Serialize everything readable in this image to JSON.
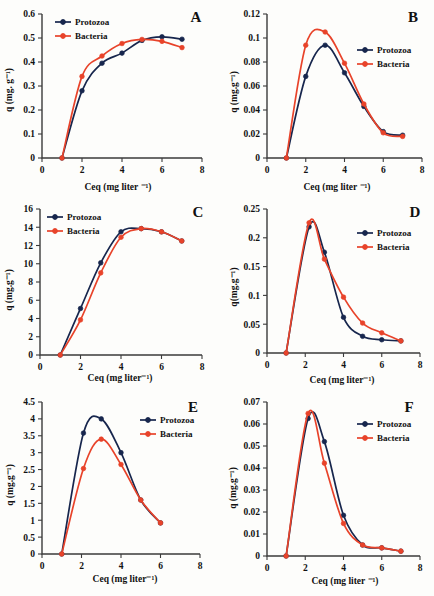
{
  "figure": {
    "legend": {
      "protozoa": "Protozoa",
      "bacteria": "Bacteria"
    },
    "colors": {
      "protozoa": "#17264d",
      "bacteria": "#e8432a"
    },
    "axis_labels": {
      "x": "Ceq (mg liter ⁻¹)",
      "x_alt": "Ceq (mg liter⁻¹)",
      "y": "q (mg. g⁻¹)",
      "y_alt": "q(mg.g⁻¹)",
      "y_f": "q (mg.g⁻¹)"
    }
  },
  "chart_data": [
    {
      "id": "A",
      "type": "line",
      "title": "A",
      "xlabel": "Ceq (mg liter ⁻¹)",
      "ylabel": "q (mg. g⁻¹)",
      "xlim": [
        0,
        8
      ],
      "ylim": [
        0,
        0.6
      ],
      "xticks": [
        0,
        2,
        4,
        6,
        8
      ],
      "yticks": [
        0,
        0.1,
        0.2,
        0.3,
        0.4,
        0.5,
        0.6
      ],
      "ytick_labels": [
        "0",
        "0.1",
        "0.2",
        "0.3",
        "0.4",
        "0.5",
        "0.6"
      ],
      "grid": false,
      "legend_position": "top-left",
      "x": [
        1,
        2,
        3,
        4,
        5,
        6,
        7
      ],
      "series": [
        {
          "name": "Protozoa",
          "values": [
            0,
            0.28,
            0.395,
            0.437,
            0.49,
            0.505,
            0.495
          ]
        },
        {
          "name": "Bacteria",
          "values": [
            0,
            0.34,
            0.425,
            0.477,
            0.494,
            0.486,
            0.46
          ]
        }
      ]
    },
    {
      "id": "B",
      "type": "line",
      "title": "B",
      "xlabel": "Ceq (mg liter ⁻¹)",
      "ylabel": "q (mg.g⁻¹)",
      "xlim": [
        0,
        8
      ],
      "ylim": [
        0,
        0.12
      ],
      "xticks": [
        0,
        2,
        4,
        6,
        8
      ],
      "yticks": [
        0,
        0.02,
        0.04,
        0.06,
        0.08,
        0.1,
        0.12
      ],
      "ytick_labels": [
        "0",
        "0.02",
        "0.04",
        "0.06",
        "0.08",
        "0.1",
        "0.12"
      ],
      "grid": false,
      "legend_position": "right",
      "x": [
        1,
        2,
        3,
        4,
        5,
        6,
        7
      ],
      "series": [
        {
          "name": "Protozoa",
          "values": [
            0,
            0.068,
            0.094,
            0.071,
            0.043,
            0.022,
            0.019
          ]
        },
        {
          "name": "Bacteria",
          "values": [
            0,
            0.094,
            0.105,
            0.079,
            0.045,
            0.021,
            0.018
          ]
        }
      ]
    },
    {
      "id": "C",
      "type": "line",
      "title": "C",
      "xlabel": "Ceq (mg liter⁻¹)",
      "ylabel": "q (mg.g⁻¹)",
      "xlim": [
        0,
        8
      ],
      "ylim": [
        0,
        16
      ],
      "xticks": [
        0,
        2,
        4,
        6,
        8
      ],
      "yticks": [
        0,
        2,
        4,
        6,
        8,
        10,
        12,
        14,
        16
      ],
      "ytick_labels": [
        "0",
        "2",
        "4",
        "6",
        "8",
        "10",
        "12",
        "14",
        "16"
      ],
      "grid": false,
      "legend_position": "top-left",
      "x": [
        1,
        2,
        3,
        4,
        5,
        6,
        7
      ],
      "series": [
        {
          "name": "Protozoa",
          "values": [
            0,
            5.1,
            10.1,
            13.5,
            13.85,
            13.5,
            12.5
          ]
        },
        {
          "name": "Bacteria",
          "values": [
            0,
            3.85,
            9.0,
            12.9,
            13.85,
            13.5,
            12.5
          ]
        }
      ]
    },
    {
      "id": "D",
      "type": "line",
      "title": "D",
      "xlabel": "Ceq (mg liter⁻¹)",
      "ylabel": "q(mg.g⁻¹)",
      "xlim": [
        0,
        8
      ],
      "ylim": [
        0,
        0.25
      ],
      "xticks": [
        0,
        2,
        4,
        6,
        8
      ],
      "yticks": [
        0,
        0.05,
        0.1,
        0.15,
        0.2,
        0.25
      ],
      "ytick_labels": [
        "0",
        "0.05",
        "0.1",
        "0.15",
        "0.2",
        "0.25"
      ],
      "grid": false,
      "legend_position": "right",
      "x": [
        1,
        2.2,
        3,
        4,
        5,
        6,
        7
      ],
      "series": [
        {
          "name": "Protozoa",
          "values": [
            0,
            0.219,
            0.175,
            0.062,
            0.029,
            0.023,
            0.021
          ]
        },
        {
          "name": "Bacteria",
          "values": [
            0,
            0.226,
            0.163,
            0.097,
            0.052,
            0.035,
            0.021
          ]
        }
      ]
    },
    {
      "id": "E",
      "type": "line",
      "title": "E",
      "xlabel": "Ceq (mg liter⁻¹)",
      "ylabel": "q (mg.g⁻¹)",
      "xlim": [
        0,
        8
      ],
      "ylim": [
        0,
        4.5
      ],
      "xticks": [
        0,
        2,
        4,
        6,
        8
      ],
      "yticks": [
        0,
        0.5,
        1,
        1.5,
        2,
        2.5,
        3,
        3.5,
        4,
        4.5
      ],
      "ytick_labels": [
        "0",
        "0.5",
        "1",
        "1.5",
        "2",
        "2.5",
        "3",
        "3.5",
        "4",
        "4.5"
      ],
      "grid": false,
      "legend_position": "right",
      "x": [
        1,
        2.1,
        3,
        4,
        5,
        6
      ],
      "series": [
        {
          "name": "Protozoa",
          "values": [
            0,
            3.58,
            4.0,
            3.0,
            1.6,
            0.92
          ]
        },
        {
          "name": "Bacteria",
          "values": [
            0,
            2.53,
            3.4,
            2.65,
            1.6,
            0.92
          ]
        }
      ]
    },
    {
      "id": "F",
      "type": "line",
      "title": "F",
      "xlabel": "Ceq (mg liter ⁻¹)",
      "ylabel": "q (mg.g⁻¹)",
      "xlim": [
        0,
        8
      ],
      "ylim": [
        0,
        0.07
      ],
      "xticks": [
        0,
        2,
        4,
        6,
        8
      ],
      "yticks": [
        0,
        0.01,
        0.02,
        0.03,
        0.04,
        0.05,
        0.06,
        0.07
      ],
      "ytick_labels": [
        "0",
        "0.01",
        "0.02",
        "0.03",
        "0.04",
        "0.05",
        "0.06",
        "0.07"
      ],
      "grid": false,
      "legend_position": "right",
      "x": [
        1,
        2.15,
        3,
        4,
        5,
        6,
        7
      ],
      "series": [
        {
          "name": "Protozoa",
          "values": [
            0,
            0.0625,
            0.052,
            0.0185,
            0.005,
            0.0037,
            0.0022
          ]
        },
        {
          "name": "Bacteria",
          "values": [
            0,
            0.0648,
            0.0422,
            0.0148,
            0.005,
            0.0037,
            0.0022
          ]
        }
      ]
    }
  ]
}
